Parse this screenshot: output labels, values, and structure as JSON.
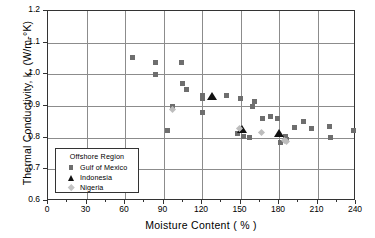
{
  "chart_data": {
    "type": "scatter",
    "title": "",
    "xlabel": "Moisture Content ( % )",
    "ylabel": "Thermal Conductivity, k, (W/m-°K)",
    "xlim": [
      0,
      240
    ],
    "ylim": [
      0.6,
      1.2
    ],
    "xticks": [
      0,
      30,
      60,
      90,
      120,
      150,
      180,
      210,
      240
    ],
    "yticks": [
      0.6,
      0.7,
      0.8,
      0.9,
      1.0,
      1.1,
      1.2
    ],
    "xtick_labels": [
      "0",
      "30",
      "60",
      "90",
      "120",
      "150",
      "180",
      "210",
      "240"
    ],
    "ytick_labels": [
      "0.6",
      "0.7",
      "0.8",
      "0.9",
      "1.0",
      "1.1",
      "1.2"
    ],
    "grid": true,
    "legend_position": "lower left",
    "legend_title": "Offshore Region",
    "series": [
      {
        "name": "Gulf of Mexico",
        "marker": "square",
        "color": "#6e6e6e",
        "points": [
          [
            66,
            1.053
          ],
          [
            84,
            1.036
          ],
          [
            84,
            1.001
          ],
          [
            93,
            0.823
          ],
          [
            97,
            0.899
          ],
          [
            104,
            1.038
          ],
          [
            105,
            0.972
          ],
          [
            108,
            0.953
          ],
          [
            120,
            0.932
          ],
          [
            120,
            0.925
          ],
          [
            120,
            0.878
          ],
          [
            139,
            0.933
          ],
          [
            148,
            0.812
          ],
          [
            150,
            0.923
          ],
          [
            152,
            0.803
          ],
          [
            157,
            0.801
          ],
          [
            159,
            0.897
          ],
          [
            161,
            0.913
          ],
          [
            167,
            0.861
          ],
          [
            173,
            0.866
          ],
          [
            179,
            0.859
          ],
          [
            181,
            0.786
          ],
          [
            185,
            0.805
          ],
          [
            186,
            0.793
          ],
          [
            192,
            0.833
          ],
          [
            199,
            0.85
          ],
          [
            205,
            0.828
          ],
          [
            219,
            0.836
          ],
          [
            220,
            0.8
          ],
          [
            238,
            0.822
          ]
        ]
      },
      {
        "name": "Indonesia",
        "marker": "triangle",
        "color": "#111111",
        "points": [
          [
            128,
            0.932
          ],
          [
            151,
            0.826
          ],
          [
            180,
            0.815
          ]
        ]
      },
      {
        "name": "Nigeria",
        "marker": "diamond",
        "color": "#bdbdbd",
        "points": [
          [
            97,
            0.89
          ],
          [
            149,
            0.829
          ],
          [
            166,
            0.817
          ],
          [
            184,
            0.791
          ],
          [
            186,
            0.788
          ]
        ]
      }
    ]
  }
}
